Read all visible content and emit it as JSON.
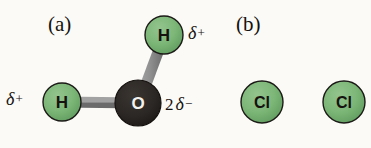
{
  "figure": {
    "background_color": "#fbfaf7",
    "panels": [
      {
        "id": "a",
        "label": "(a)",
        "molecule": "water"
      },
      {
        "id": "b",
        "label": "(b)",
        "molecule": "chlorine"
      }
    ]
  },
  "colors": {
    "background": "#fbfaf7",
    "atom_green_fill": "#79b474",
    "atom_green_stroke": "#1c1a17",
    "atom_dark_fill": "#2b2724",
    "atom_dark_stroke": "#15120f",
    "bond_gray": "#8c8c8c",
    "bond_gray_dark": "#6f6f6f",
    "text_dark": "#15120f",
    "text_light": "#fbfaf7"
  },
  "panel_a": {
    "label": "(a)",
    "atoms": [
      {
        "name": "hydrogen-left",
        "symbol": "H",
        "color": "green",
        "cx": 62,
        "cy": 102,
        "r": 19
      },
      {
        "name": "hydrogen-top",
        "symbol": "H",
        "color": "green",
        "cx": 164,
        "cy": 35,
        "r": 19
      },
      {
        "name": "oxygen-center",
        "symbol": "O",
        "color": "dark",
        "cx": 138,
        "cy": 103,
        "r": 23
      }
    ],
    "bonds": [
      {
        "name": "bond-h-left-o",
        "x1": 62,
        "y1": 102,
        "x2": 138,
        "y2": 103,
        "width": 11
      },
      {
        "name": "bond-o-h-top",
        "x1": 138,
        "y1": 103,
        "x2": 164,
        "y2": 35,
        "width": 11
      }
    ],
    "charges": [
      {
        "name": "partial-positive-h-left",
        "coefficient": "",
        "delta": "δ",
        "sign": "+"
      },
      {
        "name": "partial-positive-h-top",
        "coefficient": "",
        "delta": "δ",
        "sign": "+"
      },
      {
        "name": "partial-negative-oxygen",
        "coefficient": "2",
        "delta": "δ",
        "sign": "−"
      }
    ]
  },
  "panel_b": {
    "label": "(b)",
    "atoms": [
      {
        "name": "chlorine-left",
        "symbol": "Cl",
        "color": "green",
        "cx": 262,
        "cy": 102,
        "r": 21
      },
      {
        "name": "chlorine-right",
        "symbol": "Cl",
        "color": "green",
        "cx": 344,
        "cy": 102,
        "r": 21
      }
    ],
    "bonds": [
      {
        "name": "bond-cl-cl",
        "x1": 262,
        "y1": 102,
        "x2": 344,
        "y2": 102,
        "width": 11
      }
    ],
    "charges": []
  },
  "labels": {
    "panel_a": "(a)",
    "panel_b": "(b)",
    "atom_h": "H",
    "atom_o": "O",
    "atom_cl": "Cl",
    "delta": "δ",
    "plus": "+",
    "minus": "−",
    "two": "2"
  }
}
